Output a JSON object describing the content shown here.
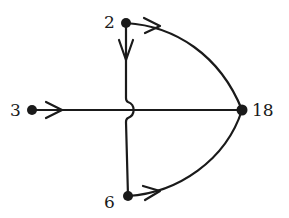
{
  "diagram": {
    "type": "directed-graph",
    "colors": {
      "stroke": "#1a1a1a",
      "background": "#ffffff"
    },
    "nodes": [
      {
        "id": "n2",
        "label": "2",
        "x": 126,
        "y": 23
      },
      {
        "id": "n3",
        "label": "3",
        "x": 32,
        "y": 110
      },
      {
        "id": "n18",
        "label": "18",
        "x": 242,
        "y": 110
      },
      {
        "id": "n6",
        "label": "6",
        "x": 128,
        "y": 196
      }
    ],
    "edges": [
      {
        "from": "2",
        "to": "6",
        "shape": "straight-vertical",
        "note": "hops over edge 3→18"
      },
      {
        "from": "3",
        "to": "18",
        "shape": "straight-horizontal"
      },
      {
        "from": "2",
        "to": "18",
        "shape": "curve"
      },
      {
        "from": "6",
        "to": "18",
        "shape": "curve"
      }
    ]
  }
}
